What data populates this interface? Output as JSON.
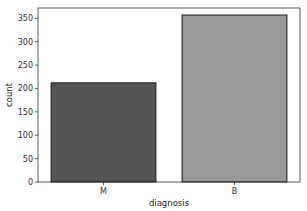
{
  "chart_data": {
    "type": "bar",
    "title": "",
    "xlabel": "diagnosis",
    "ylabel": "count",
    "categories": [
      "M",
      "B"
    ],
    "values": [
      212,
      357
    ],
    "ylim": [
      0,
      372
    ],
    "yticks": [
      0,
      50,
      100,
      150,
      200,
      250,
      300,
      350
    ],
    "grid": false,
    "legend": null,
    "colors": [
      "#555555",
      "#999999"
    ],
    "edgecolor": "#1a1a1a"
  }
}
